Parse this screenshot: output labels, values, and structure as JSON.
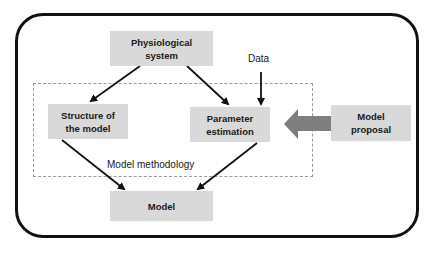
{
  "diagram": {
    "nodes": {
      "physiological_system": "Physiological\nsystem",
      "structure_of_model": "Structure of\nthe model",
      "parameter_estimation": "Parameter\nestimation",
      "model_proposal": "Model\nproposal",
      "model": "Model"
    },
    "labels": {
      "data": "Data",
      "model_methodology": "Model methodology"
    },
    "edges": [
      {
        "from": "physiological_system",
        "to": "structure_of_model"
      },
      {
        "from": "physiological_system",
        "to": "parameter_estimation"
      },
      {
        "from": "data",
        "to": "parameter_estimation"
      },
      {
        "from": "model_proposal",
        "to": "parameter_estimation",
        "style": "thick-gray"
      },
      {
        "from": "structure_of_model",
        "to": "model"
      },
      {
        "from": "parameter_estimation",
        "to": "model"
      }
    ],
    "colors": {
      "box_fill": "#d9d9d9",
      "frame": "#111111",
      "dashed": "#9a9a9a",
      "big_arrow": "#7f7f7f"
    }
  }
}
